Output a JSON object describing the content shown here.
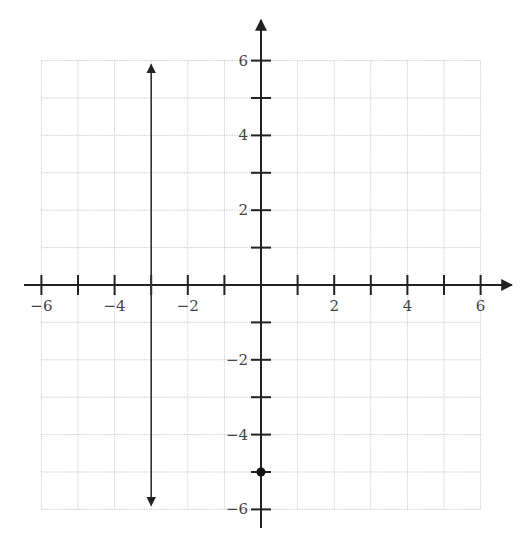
{
  "chart_data": {
    "type": "line",
    "title": "",
    "xlabel": "",
    "ylabel": "",
    "xlim": [
      -6,
      6
    ],
    "ylim": [
      -6,
      6
    ],
    "grid": true,
    "x_tick_labels": [
      "−6",
      "−4",
      "−2",
      "2",
      "4",
      "6"
    ],
    "x_tick_values": [
      -6,
      -4,
      -2,
      2,
      4,
      6
    ],
    "y_tick_labels": [
      "6",
      "4",
      "2",
      "−2",
      "−4",
      "−6"
    ],
    "y_tick_values": [
      6,
      4,
      2,
      -2,
      -4,
      -6
    ],
    "series": [
      {
        "name": "vertical line x = -3",
        "kind": "line",
        "equation": "x = -3",
        "points": [
          [
            -3,
            -6
          ],
          [
            -3,
            6
          ]
        ],
        "arrows": "both"
      },
      {
        "name": "point",
        "kind": "point",
        "points": [
          [
            0,
            -5
          ]
        ]
      }
    ],
    "axes": {
      "x_arrow": "positive end only",
      "y_arrow": "positive end only"
    },
    "colors": {
      "axis": "#222222",
      "grid": "#d0d0d0",
      "line": "#333333",
      "point": "#111111"
    }
  }
}
